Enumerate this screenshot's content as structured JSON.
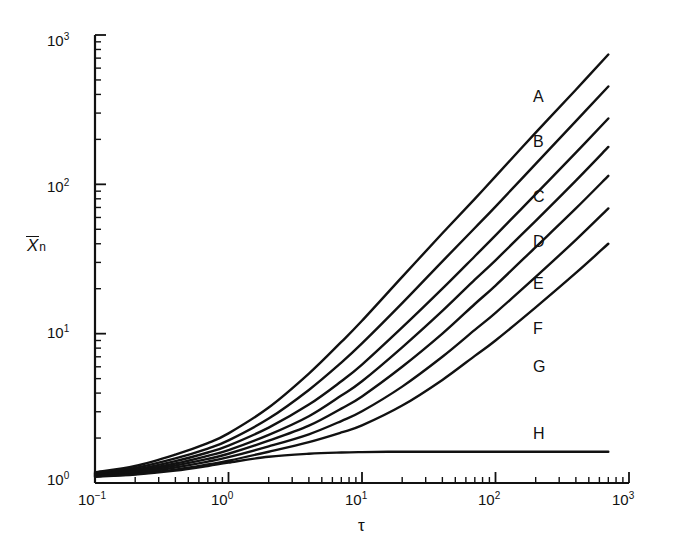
{
  "chart_data": {
    "type": "line",
    "title": "",
    "xlabel": "τ",
    "ylabel": "X̄n",
    "xscale": "log",
    "yscale": "log",
    "xlim": [
      0.1,
      1000
    ],
    "ylim": [
      1,
      1000
    ],
    "grid": false,
    "legend_position": "inline-right",
    "x_tick_labels": [
      "10⁻¹",
      "10⁰",
      "10¹",
      "10²",
      "10³"
    ],
    "x_tick_values": [
      0.1,
      1,
      10,
      100,
      1000
    ],
    "y_tick_labels": [
      "10⁰",
      "10¹",
      "10²",
      "10³"
    ],
    "y_tick_values": [
      1,
      10,
      100,
      1000
    ],
    "series": [
      {
        "name": "A",
        "label": "A",
        "x": [
          0.1,
          0.2,
          0.4,
          0.7,
          1.0,
          2.0,
          4.0,
          7.0,
          10.0,
          20.0,
          40.0,
          70.0,
          100.0,
          200.0,
          400.0,
          700.0
        ],
        "values": [
          1.18,
          1.3,
          1.55,
          1.85,
          2.15,
          3.2,
          5.4,
          8.8,
          12.2,
          24.0,
          47.0,
          80.0,
          113.0,
          222.0,
          430.0,
          740.0
        ]
      },
      {
        "name": "B",
        "label": "B",
        "x": [
          0.1,
          0.2,
          0.4,
          0.7,
          1.0,
          2.0,
          4.0,
          7.0,
          10.0,
          20.0,
          40.0,
          70.0,
          100.0,
          200.0,
          400.0,
          700.0
        ],
        "values": [
          1.16,
          1.26,
          1.46,
          1.7,
          1.93,
          2.7,
          4.2,
          6.4,
          8.6,
          16.0,
          30.5,
          51.0,
          71.0,
          137.0,
          265.0,
          452.0
        ]
      },
      {
        "name": "C",
        "label": "C",
        "x": [
          0.1,
          0.2,
          0.4,
          0.7,
          1.0,
          2.0,
          4.0,
          7.0,
          10.0,
          20.0,
          40.0,
          70.0,
          100.0,
          200.0,
          400.0,
          700.0
        ],
        "values": [
          1.15,
          1.23,
          1.4,
          1.6,
          1.78,
          2.35,
          3.35,
          4.8,
          6.2,
          11.0,
          20.0,
          33.0,
          45.5,
          86.0,
          163.0,
          276.0
        ]
      },
      {
        "name": "D",
        "label": "D",
        "x": [
          0.1,
          0.2,
          0.4,
          0.7,
          1.0,
          2.0,
          4.0,
          7.0,
          10.0,
          20.0,
          40.0,
          70.0,
          100.0,
          200.0,
          400.0,
          700.0
        ],
        "values": [
          1.14,
          1.21,
          1.35,
          1.52,
          1.66,
          2.1,
          2.8,
          3.85,
          4.8,
          8.1,
          14.2,
          23.0,
          31.0,
          57.0,
          106.0,
          178.0
        ]
      },
      {
        "name": "E",
        "label": "E",
        "x": [
          0.1,
          0.2,
          0.4,
          0.7,
          1.0,
          2.0,
          4.0,
          7.0,
          10.0,
          20.0,
          40.0,
          70.0,
          100.0,
          200.0,
          400.0,
          700.0
        ],
        "values": [
          1.13,
          1.19,
          1.31,
          1.45,
          1.57,
          1.92,
          2.42,
          3.15,
          3.8,
          6.0,
          10.0,
          15.8,
          21.0,
          38.0,
          69.0,
          114.0
        ]
      },
      {
        "name": "F",
        "label": "F",
        "x": [
          0.1,
          0.2,
          0.4,
          0.7,
          1.0,
          2.0,
          4.0,
          7.0,
          10.0,
          20.0,
          40.0,
          70.0,
          100.0,
          200.0,
          400.0,
          700.0
        ],
        "values": [
          1.12,
          1.17,
          1.27,
          1.39,
          1.49,
          1.76,
          2.12,
          2.6,
          3.02,
          4.42,
          7.0,
          10.6,
          13.8,
          24.0,
          42.5,
          69.0
        ]
      },
      {
        "name": "G",
        "label": "G",
        "x": [
          0.1,
          0.2,
          0.4,
          0.7,
          1.0,
          2.0,
          4.0,
          7.0,
          10.0,
          20.0,
          40.0,
          70.0,
          100.0,
          200.0,
          400.0,
          700.0
        ],
        "values": [
          1.11,
          1.15,
          1.23,
          1.33,
          1.41,
          1.62,
          1.88,
          2.18,
          2.43,
          3.3,
          4.9,
          7.1,
          9.0,
          15.0,
          25.5,
          40.0
        ]
      },
      {
        "name": "H",
        "label": "H",
        "x": [
          0.1,
          0.2,
          0.4,
          0.7,
          1.0,
          2.0,
          4.0,
          7.0,
          10.0,
          20.0,
          40.0,
          70.0,
          100.0,
          200.0,
          400.0,
          700.0
        ],
        "values": [
          1.1,
          1.14,
          1.21,
          1.3,
          1.37,
          1.5,
          1.57,
          1.6,
          1.61,
          1.62,
          1.62,
          1.62,
          1.62,
          1.62,
          1.62,
          1.62
        ]
      }
    ],
    "curve_labels": [
      {
        "text": "A",
        "x": 533,
        "y": 88
      },
      {
        "text": "B",
        "x": 533,
        "y": 133
      },
      {
        "text": "C",
        "x": 533,
        "y": 188
      },
      {
        "text": "D",
        "x": 533,
        "y": 233
      },
      {
        "text": "E",
        "x": 533,
        "y": 275
      },
      {
        "text": "F",
        "x": 533,
        "y": 320
      },
      {
        "text": "G",
        "x": 533,
        "y": 358
      },
      {
        "text": "H",
        "x": 533,
        "y": 425
      }
    ]
  },
  "axes": {
    "x_title": "τ",
    "y_title_base": "X",
    "y_title_sub": "n",
    "x_labels": [
      {
        "m": "10",
        "e": "−1",
        "px": 95
      },
      {
        "m": "10",
        "e": "0",
        "px": 228
      },
      {
        "m": "10",
        "e": "1",
        "px": 362
      },
      {
        "m": "10",
        "e": "2",
        "px": 495
      },
      {
        "m": "10",
        "e": "3",
        "px": 629
      }
    ],
    "y_labels": [
      {
        "m": "10",
        "e": "0",
        "py": 483
      },
      {
        "m": "10",
        "e": "1",
        "py": 336
      },
      {
        "m": "10",
        "e": "2",
        "py": 190
      },
      {
        "m": "10",
        "e": "3",
        "py": 44
      }
    ]
  },
  "style": {
    "line_color": "#111111",
    "axis_color": "#111111",
    "background": "#ffffff"
  }
}
